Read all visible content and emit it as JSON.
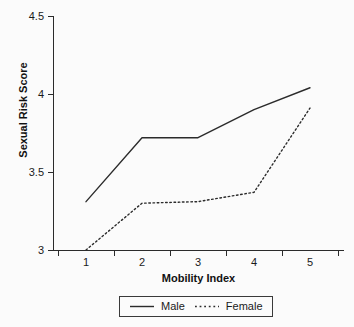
{
  "chart_data": {
    "type": "line",
    "title": "",
    "xlabel": "Mobility Index",
    "ylabel": "Sexual Risk Score",
    "categories": [
      "1",
      "2",
      "3",
      "4",
      "5"
    ],
    "x": [
      1,
      2,
      3,
      4,
      5
    ],
    "ylim": [
      3,
      4.5
    ],
    "xlim": [
      0.5,
      5.5
    ],
    "yticks": [
      "3",
      "3.5",
      "4",
      "4.5"
    ],
    "ytick_values": [
      3,
      3.5,
      4,
      4.5
    ],
    "xticks": [
      "1",
      "2",
      "3",
      "4",
      "5"
    ],
    "grid": false,
    "legend_position": "bottom-center",
    "series": [
      {
        "name": "Male",
        "style": "solid",
        "color": "#2b2b2b",
        "values": [
          3.31,
          3.72,
          3.72,
          3.9,
          4.04
        ]
      },
      {
        "name": "Female",
        "style": "dotted",
        "color": "#2b2b2b",
        "values": [
          3.0,
          3.3,
          3.31,
          3.37,
          3.91
        ]
      }
    ]
  },
  "axes": {
    "y": {
      "title": "Sexual Risk Score",
      "tick_labels": [
        "4.5",
        "4",
        "3.5",
        "3"
      ]
    },
    "x": {
      "title": "Mobility Index",
      "tick_labels": [
        "1",
        "2",
        "3",
        "4",
        "5"
      ]
    }
  },
  "legend": {
    "entries": [
      {
        "label": "Male",
        "style": "solid"
      },
      {
        "label": "Female",
        "style": "dotted"
      }
    ]
  }
}
